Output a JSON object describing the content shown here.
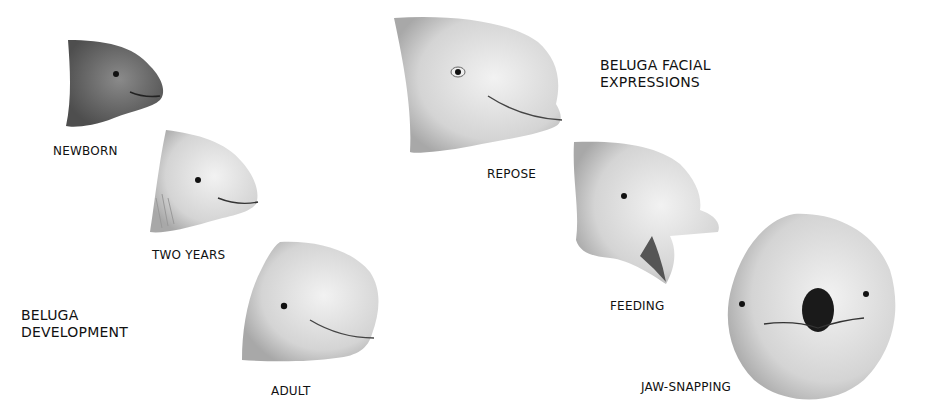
{
  "development": {
    "title_line1": "BELUGA",
    "title_line2": "DEVELOPMENT",
    "stages": [
      {
        "label": "NEWBORN"
      },
      {
        "label": "TWO YEARS"
      },
      {
        "label": "ADULT"
      }
    ]
  },
  "expressions": {
    "title_line1": "BELUGA FACIAL",
    "title_line2": "EXPRESSIONS",
    "items": [
      {
        "label": "REPOSE"
      },
      {
        "label": "FEEDING"
      },
      {
        "label": "JAW-SNAPPING"
      }
    ]
  },
  "colors": {
    "background": "#ffffff",
    "text": "#111111",
    "newborn_shade": "#6e6e6e",
    "sketch_shade": "#c8c8c8"
  }
}
